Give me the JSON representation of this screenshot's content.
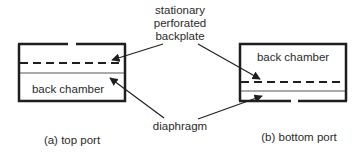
{
  "diagram": {
    "colors": {
      "stroke": "#1e1e1e",
      "text": "#2a2a2a",
      "background": "#ffffff"
    },
    "callouts": {
      "backplate": [
        "stationary",
        "perforated",
        "backplate"
      ],
      "diaphragm": "diaphragm"
    },
    "panels": [
      {
        "id": "a",
        "caption": "(a) top port",
        "chamber_label": "back chamber",
        "port_position": "top"
      },
      {
        "id": "b",
        "caption": "(b) bottom port",
        "chamber_label": "back chamber",
        "port_position": "bottom"
      }
    ]
  }
}
